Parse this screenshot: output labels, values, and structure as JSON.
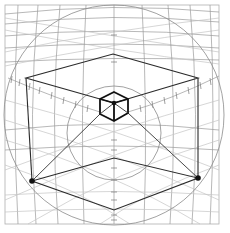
{
  "diagram": {
    "title": "",
    "colors": {
      "background": "#ffffff",
      "grid": "#9a9a9a",
      "cube": "#2a2a2a",
      "dot": "#111111"
    },
    "frame": {
      "x": 5,
      "y": 5,
      "width": 214,
      "height": 219
    },
    "circles": [
      {
        "name": "outer-horizon-circle",
        "cx": 114,
        "cy": 115,
        "r": 110
      },
      {
        "name": "inner-circle",
        "cx": 114,
        "cy": 133,
        "r": 47
      }
    ],
    "large_cube_top": [
      [
        113,
        54
      ],
      [
        198,
        78
      ],
      [
        114,
        103
      ],
      [
        26,
        78
      ]
    ],
    "small_cube": {
      "top": [
        114,
        92
      ],
      "left_top": [
        100,
        99
      ],
      "right_top": [
        128,
        99
      ],
      "center": [
        114,
        103
      ],
      "left_bottom": [
        100,
        114
      ],
      "right_bottom": [
        128,
        113
      ],
      "bottom": [
        114,
        121
      ]
    },
    "ground_diamond": [
      [
        32,
        181
      ],
      [
        114,
        158
      ],
      [
        198,
        178
      ],
      [
        114,
        210
      ]
    ],
    "vanishing_points": [
      {
        "name": "left-vanishing-point",
        "x": 32,
        "y": 181
      },
      {
        "name": "right-vanishing-point",
        "x": 198,
        "y": 178
      }
    ]
  }
}
